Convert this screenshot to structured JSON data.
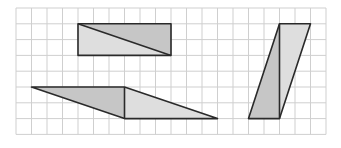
{
  "diagram": {
    "type": "grid-shapes",
    "grid": {
      "origin_px": [
        16,
        8
      ],
      "cell_px": [
        15.5,
        15.8
      ],
      "cols": 20,
      "rows": 8,
      "line_color": "#cfcfcf",
      "background": "#ffffff"
    },
    "colors": {
      "stroke": "#2a2a2a",
      "fill_dark": "#c6c6c6",
      "fill_light": "#dedede"
    },
    "shapes": [
      {
        "name": "rectangle-split-diagonal",
        "kind": "rectangle",
        "vertices_grid": [
          [
            4,
            1
          ],
          [
            10,
            1
          ],
          [
            10,
            3
          ],
          [
            4,
            3
          ]
        ],
        "split_line_grid": [
          [
            4,
            1
          ],
          [
            10,
            3
          ]
        ],
        "parts": [
          {
            "name": "upper-right-triangle",
            "points_grid": [
              [
                4,
                1
              ],
              [
                10,
                1
              ],
              [
                10,
                3
              ]
            ],
            "fill": "dark"
          },
          {
            "name": "lower-left-triangle",
            "points_grid": [
              [
                4,
                1
              ],
              [
                10,
                3
              ],
              [
                4,
                3
              ]
            ],
            "fill": "light"
          }
        ]
      },
      {
        "name": "horizontal-parallelogram",
        "kind": "parallelogram",
        "vertices_grid": [
          [
            1,
            5
          ],
          [
            7,
            5
          ],
          [
            13,
            7
          ],
          [
            7,
            7
          ]
        ],
        "split_line_grid": [
          [
            7,
            5
          ],
          [
            7,
            7
          ]
        ],
        "parts": [
          {
            "name": "left-triangle",
            "points_grid": [
              [
                1,
                5
              ],
              [
                7,
                5
              ],
              [
                7,
                7
              ]
            ],
            "fill": "dark"
          },
          {
            "name": "right-triangle",
            "points_grid": [
              [
                7,
                5
              ],
              [
                13,
                7
              ],
              [
                7,
                7
              ]
            ],
            "fill": "light"
          }
        ]
      },
      {
        "name": "vertical-parallelogram",
        "kind": "parallelogram",
        "vertices_grid": [
          [
            17,
            1
          ],
          [
            19,
            1
          ],
          [
            17,
            7
          ],
          [
            15,
            7
          ]
        ],
        "split_line_grid": [
          [
            17,
            1
          ],
          [
            17,
            7
          ]
        ],
        "parts": [
          {
            "name": "left-triangle",
            "points_grid": [
              [
                17,
                1
              ],
              [
                17,
                7
              ],
              [
                15,
                7
              ]
            ],
            "fill": "dark"
          },
          {
            "name": "right-triangle",
            "points_grid": [
              [
                17,
                1
              ],
              [
                19,
                1
              ],
              [
                17,
                7
              ]
            ],
            "fill": "light"
          }
        ]
      }
    ]
  }
}
